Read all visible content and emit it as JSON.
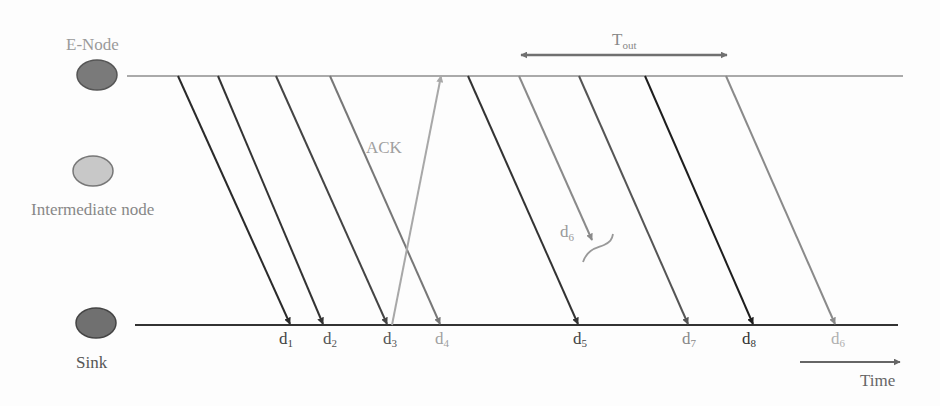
{
  "nodes": {
    "enode": {
      "label": "E-Node",
      "color": "#7a7a7a",
      "label_color": "#9a9a9a"
    },
    "intermediate": {
      "label": "Intermediate node",
      "color": "#c8c8c8",
      "label_color": "#888888"
    },
    "sink": {
      "label": "Sink",
      "color": "#707070",
      "label_color": "#555555"
    }
  },
  "timeout": {
    "label": "T",
    "sub": "out",
    "x1": 518,
    "x2": 730,
    "y": 55
  },
  "ack": {
    "label": "ACK",
    "color": "#a8a8a8",
    "x1": 392,
    "y1": 325,
    "x2": 441,
    "y2": 76
  },
  "lost_packet": {
    "label": "d",
    "sub": "6",
    "x1": 519,
    "y1": 76,
    "x2": 592,
    "y2": 240,
    "color": "#8a8a8a"
  },
  "time_axis": {
    "label": "Time"
  },
  "packets": [
    {
      "label": "d",
      "sub": "1",
      "x1": 178,
      "x2": 290,
      "color": "#2a2a2a",
      "label_color": "#444444"
    },
    {
      "label": "d",
      "sub": "2",
      "x1": 218,
      "x2": 323,
      "color": "#333333",
      "label_color": "#555555"
    },
    {
      "label": "d",
      "sub": "3",
      "x1": 276,
      "x2": 387,
      "color": "#444444",
      "label_color": "#555555"
    },
    {
      "label": "d",
      "sub": "4",
      "x1": 330,
      "x2": 440,
      "color": "#777777",
      "label_color": "#a0a0a0"
    },
    {
      "label": "d",
      "sub": "5",
      "x1": 468,
      "x2": 578,
      "color": "#333333",
      "label_color": "#444444"
    },
    {
      "label": "d",
      "sub": "7",
      "x1": 579,
      "x2": 688,
      "color": "#555555",
      "label_color": "#888888"
    },
    {
      "label": "d",
      "sub": "8",
      "x1": 645,
      "x2": 753,
      "color": "#1e1e1e",
      "label_color": "#333333"
    },
    {
      "label": "d",
      "sub": "6",
      "x1": 726,
      "x2": 835,
      "color": "#8a8a8a",
      "label_color": "#b0b0b0"
    }
  ]
}
